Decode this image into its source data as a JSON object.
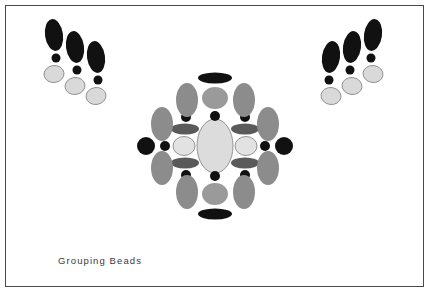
{
  "figure": {
    "caption": "Grouping Beads",
    "width": 431,
    "height": 295,
    "background_color": "#ffffff",
    "border_color": "#4a4a4a",
    "caption_color": "#3a3a3a"
  },
  "palette": {
    "black": "#111111",
    "dark_gray": "#5a5a5a",
    "medium_gray": "#8c8c8c",
    "light_gray_fill": "#d9d9d9",
    "pale_fill": "#e0e0e0",
    "outline": "#8a8a8a"
  },
  "groups": [
    {
      "name": "left-bead-group",
      "label": "Left bead group",
      "strand_count": 3,
      "strands": [
        {
          "name": "left-strand-1",
          "beads": [
            {
              "name": "dark-oval-bead",
              "shape": "ellipse",
              "cx": 54,
              "cy": 35,
              "rx": 9,
              "ry": 16,
              "rotate": -8,
              "fill": "#111111",
              "stroke": "none"
            },
            {
              "name": "small-black-bead",
              "shape": "circle",
              "cx": 56,
              "cy": 58,
              "rx": 4.5,
              "ry": 4.5,
              "rotate": 0,
              "fill": "#111111",
              "stroke": "none"
            },
            {
              "name": "light-round-bead",
              "shape": "ellipse",
              "cx": 54,
              "cy": 74,
              "rx": 10,
              "ry": 8.5,
              "rotate": -8,
              "fill": "#d9d9d9",
              "stroke": "#8a8a8a"
            }
          ]
        },
        {
          "name": "left-strand-2",
          "beads": [
            {
              "name": "dark-oval-bead",
              "shape": "ellipse",
              "cx": 75,
              "cy": 47,
              "rx": 9,
              "ry": 16,
              "rotate": -8,
              "fill": "#111111",
              "stroke": "none"
            },
            {
              "name": "small-black-bead",
              "shape": "circle",
              "cx": 77,
              "cy": 70,
              "rx": 4.5,
              "ry": 4.5,
              "rotate": 0,
              "fill": "#111111",
              "stroke": "none"
            },
            {
              "name": "light-round-bead",
              "shape": "ellipse",
              "cx": 75,
              "cy": 86,
              "rx": 10,
              "ry": 8.5,
              "rotate": -8,
              "fill": "#d9d9d9",
              "stroke": "#8a8a8a"
            }
          ]
        },
        {
          "name": "left-strand-3",
          "beads": [
            {
              "name": "dark-oval-bead",
              "shape": "ellipse",
              "cx": 96,
              "cy": 57,
              "rx": 9,
              "ry": 16,
              "rotate": -8,
              "fill": "#111111",
              "stroke": "none"
            },
            {
              "name": "small-black-bead",
              "shape": "circle",
              "cx": 98,
              "cy": 80,
              "rx": 4.5,
              "ry": 4.5,
              "rotate": 0,
              "fill": "#111111",
              "stroke": "none"
            },
            {
              "name": "light-round-bead",
              "shape": "ellipse",
              "cx": 96,
              "cy": 96,
              "rx": 10,
              "ry": 8.5,
              "rotate": -8,
              "fill": "#d9d9d9",
              "stroke": "#8a8a8a"
            }
          ]
        }
      ]
    },
    {
      "name": "right-bead-group",
      "label": "Right bead group",
      "strand_count": 3,
      "strands": [
        {
          "name": "right-strand-1",
          "beads": [
            {
              "name": "dark-oval-bead",
              "shape": "ellipse",
              "cx": 331,
              "cy": 57,
              "rx": 9,
              "ry": 16,
              "rotate": 8,
              "fill": "#111111",
              "stroke": "none"
            },
            {
              "name": "small-black-bead",
              "shape": "circle",
              "cx": 329,
              "cy": 80,
              "rx": 4.5,
              "ry": 4.5,
              "rotate": 0,
              "fill": "#111111",
              "stroke": "none"
            },
            {
              "name": "light-round-bead",
              "shape": "ellipse",
              "cx": 331,
              "cy": 96,
              "rx": 10,
              "ry": 8.5,
              "rotate": 8,
              "fill": "#d9d9d9",
              "stroke": "#8a8a8a"
            }
          ]
        },
        {
          "name": "right-strand-2",
          "beads": [
            {
              "name": "dark-oval-bead",
              "shape": "ellipse",
              "cx": 352,
              "cy": 47,
              "rx": 9,
              "ry": 16,
              "rotate": 8,
              "fill": "#111111",
              "stroke": "none"
            },
            {
              "name": "small-black-bead",
              "shape": "circle",
              "cx": 350,
              "cy": 70,
              "rx": 4.5,
              "ry": 4.5,
              "rotate": 0,
              "fill": "#111111",
              "stroke": "none"
            },
            {
              "name": "light-round-bead",
              "shape": "ellipse",
              "cx": 352,
              "cy": 86,
              "rx": 10,
              "ry": 8.5,
              "rotate": 8,
              "fill": "#d9d9d9",
              "stroke": "#8a8a8a"
            }
          ]
        },
        {
          "name": "right-strand-3",
          "beads": [
            {
              "name": "dark-oval-bead",
              "shape": "ellipse",
              "cx": 373,
              "cy": 35,
              "rx": 9,
              "ry": 16,
              "rotate": 8,
              "fill": "#111111",
              "stroke": "none"
            },
            {
              "name": "small-black-bead",
              "shape": "circle",
              "cx": 371,
              "cy": 58,
              "rx": 4.5,
              "ry": 4.5,
              "rotate": 0,
              "fill": "#111111",
              "stroke": "none"
            },
            {
              "name": "light-round-bead",
              "shape": "ellipse",
              "cx": 373,
              "cy": 74,
              "rx": 10,
              "ry": 8.5,
              "rotate": 8,
              "fill": "#d9d9d9",
              "stroke": "#8a8a8a"
            }
          ]
        }
      ]
    },
    {
      "name": "center-bead-rosette",
      "label": "Center bead rosette",
      "strand_count": 1,
      "strands": [
        {
          "name": "center-rosette-beads",
          "beads": [
            {
              "name": "center-large-oval-bead",
              "shape": "ellipse",
              "cx": 215,
              "cy": 146,
              "rx": 18,
              "ry": 27,
              "rotate": 0,
              "fill": "#dcdcdc",
              "stroke": "#8a8a8a"
            },
            {
              "name": "top-black-flat-bead",
              "shape": "ellipse",
              "cx": 215,
              "cy": 78,
              "rx": 17,
              "ry": 5.5,
              "rotate": 0,
              "fill": "#111111",
              "stroke": "none"
            },
            {
              "name": "top-gray-round-bead",
              "shape": "ellipse",
              "cx": 215,
              "cy": 98,
              "rx": 13,
              "ry": 11,
              "rotate": 0,
              "fill": "#9a9a9a",
              "stroke": "none"
            },
            {
              "name": "top-small-black-bead",
              "shape": "circle",
              "cx": 215,
              "cy": 116,
              "rx": 5,
              "ry": 5,
              "rotate": 0,
              "fill": "#111111",
              "stroke": "none"
            },
            {
              "name": "bottom-black-flat-bead",
              "shape": "ellipse",
              "cx": 215,
              "cy": 214,
              "rx": 17,
              "ry": 5.5,
              "rotate": 0,
              "fill": "#111111",
              "stroke": "none"
            },
            {
              "name": "bottom-gray-round-bead",
              "shape": "ellipse",
              "cx": 215,
              "cy": 194,
              "rx": 13,
              "ry": 11,
              "rotate": 0,
              "fill": "#9a9a9a",
              "stroke": "none"
            },
            {
              "name": "bottom-small-black-bead",
              "shape": "circle",
              "cx": 215,
              "cy": 176,
              "rx": 5,
              "ry": 5,
              "rotate": 0,
              "fill": "#111111",
              "stroke": "none"
            },
            {
              "name": "left-black-round-bead",
              "shape": "circle",
              "cx": 146,
              "cy": 146,
              "rx": 9,
              "ry": 9,
              "rotate": 0,
              "fill": "#111111",
              "stroke": "none"
            },
            {
              "name": "left-small-black-bead",
              "shape": "circle",
              "cx": 165,
              "cy": 146,
              "rx": 5,
              "ry": 5,
              "rotate": 0,
              "fill": "#111111",
              "stroke": "none"
            },
            {
              "name": "right-black-round-bead",
              "shape": "circle",
              "cx": 284,
              "cy": 146,
              "rx": 9,
              "ry": 9,
              "rotate": 0,
              "fill": "#111111",
              "stroke": "none"
            },
            {
              "name": "right-small-black-bead",
              "shape": "circle",
              "cx": 265,
              "cy": 146,
              "rx": 5,
              "ry": 5,
              "rotate": 0,
              "fill": "#111111",
              "stroke": "none"
            },
            {
              "name": "inner-left-pale-bead",
              "shape": "ellipse",
              "cx": 184,
              "cy": 146,
              "rx": 11,
              "ry": 9.5,
              "rotate": 0,
              "fill": "#e2e2e2",
              "stroke": "#8a8a8a"
            },
            {
              "name": "inner-right-pale-bead",
              "shape": "ellipse",
              "cx": 246,
              "cy": 146,
              "rx": 11,
              "ry": 9.5,
              "rotate": 0,
              "fill": "#e2e2e2",
              "stroke": "#8a8a8a"
            },
            {
              "name": "inner-upper-left-flat-bead",
              "shape": "ellipse",
              "cx": 185,
              "cy": 129,
              "rx": 14,
              "ry": 5.5,
              "rotate": 0,
              "fill": "#5a5a5a",
              "stroke": "none"
            },
            {
              "name": "inner-upper-right-flat-bead",
              "shape": "ellipse",
              "cx": 245,
              "cy": 129,
              "rx": 14,
              "ry": 5.5,
              "rotate": 0,
              "fill": "#5a5a5a",
              "stroke": "none"
            },
            {
              "name": "inner-lower-left-flat-bead",
              "shape": "ellipse",
              "cx": 185,
              "cy": 163,
              "rx": 14,
              "ry": 5.5,
              "rotate": 0,
              "fill": "#5a5a5a",
              "stroke": "none"
            },
            {
              "name": "inner-lower-right-flat-bead",
              "shape": "ellipse",
              "cx": 245,
              "cy": 163,
              "rx": 14,
              "ry": 5.5,
              "rotate": 0,
              "fill": "#5a5a5a",
              "stroke": "none"
            },
            {
              "name": "inner-upper-left-small-black-bead",
              "shape": "circle",
              "cx": 186,
              "cy": 117,
              "rx": 5,
              "ry": 5,
              "rotate": 0,
              "fill": "#111111",
              "stroke": "none"
            },
            {
              "name": "inner-upper-right-small-black-bead",
              "shape": "circle",
              "cx": 245,
              "cy": 117,
              "rx": 5,
              "ry": 5,
              "rotate": 0,
              "fill": "#111111",
              "stroke": "none"
            },
            {
              "name": "inner-lower-left-small-black-bead",
              "shape": "circle",
              "cx": 186,
              "cy": 175,
              "rx": 5,
              "ry": 5,
              "rotate": 0,
              "fill": "#111111",
              "stroke": "none"
            },
            {
              "name": "inner-lower-right-small-black-bead",
              "shape": "circle",
              "cx": 245,
              "cy": 175,
              "rx": 5,
              "ry": 5,
              "rotate": 0,
              "fill": "#111111",
              "stroke": "none"
            },
            {
              "name": "upper-left-gray-oval-bead",
              "shape": "ellipse",
              "cx": 187,
              "cy": 100,
              "rx": 11,
              "ry": 17,
              "rotate": 0,
              "fill": "#8c8c8c",
              "stroke": "none"
            },
            {
              "name": "upper-right-gray-oval-bead",
              "shape": "ellipse",
              "cx": 244,
              "cy": 100,
              "rx": 11,
              "ry": 17,
              "rotate": 0,
              "fill": "#8c8c8c",
              "stroke": "none"
            },
            {
              "name": "lower-left-gray-oval-bead",
              "shape": "ellipse",
              "cx": 187,
              "cy": 192,
              "rx": 11,
              "ry": 17,
              "rotate": 0,
              "fill": "#8c8c8c",
              "stroke": "none"
            },
            {
              "name": "lower-right-gray-oval-bead",
              "shape": "ellipse",
              "cx": 244,
              "cy": 192,
              "rx": 11,
              "ry": 17,
              "rotate": 0,
              "fill": "#8c8c8c",
              "stroke": "none"
            },
            {
              "name": "outer-upper-left-gray-oval-bead",
              "shape": "ellipse",
              "cx": 162,
              "cy": 124,
              "rx": 11,
              "ry": 17,
              "rotate": 0,
              "fill": "#8c8c8c",
              "stroke": "none"
            },
            {
              "name": "outer-upper-right-gray-oval-bead",
              "shape": "ellipse",
              "cx": 268,
              "cy": 124,
              "rx": 11,
              "ry": 17,
              "rotate": 0,
              "fill": "#8c8c8c",
              "stroke": "none"
            },
            {
              "name": "outer-lower-left-gray-oval-bead",
              "shape": "ellipse",
              "cx": 162,
              "cy": 168,
              "rx": 11,
              "ry": 17,
              "rotate": 0,
              "fill": "#8c8c8c",
              "stroke": "none"
            },
            {
              "name": "outer-lower-right-gray-oval-bead",
              "shape": "ellipse",
              "cx": 268,
              "cy": 168,
              "rx": 11,
              "ry": 17,
              "rotate": 0,
              "fill": "#8c8c8c",
              "stroke": "none"
            }
          ]
        }
      ]
    }
  ]
}
